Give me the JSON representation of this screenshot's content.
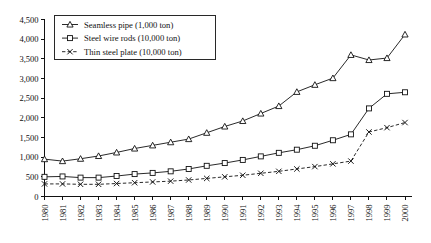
{
  "chart_data": {
    "type": "line",
    "title": "",
    "subtitle": "",
    "xlabel": "",
    "ylabel": "",
    "ylim": [
      0,
      4500
    ],
    "ytick_step": 500,
    "grid": false,
    "legend_position": "top-left",
    "x": [
      "1980",
      "1981",
      "1982",
      "1983",
      "1984",
      "1985",
      "1986",
      "1987",
      "1988",
      "1989",
      "1990",
      "1991",
      "1992",
      "1993",
      "1994",
      "1995",
      "1996",
      "1997",
      "1998",
      "1999",
      "2000"
    ],
    "ytick_labels": [
      "0",
      "500",
      "1,000",
      "1,500",
      "2,000",
      "2,500",
      "3,000",
      "3,500",
      "4,000",
      "4,500"
    ],
    "ytick_values": [
      0,
      500,
      1000,
      1500,
      2000,
      2500,
      3000,
      3500,
      4000,
      4500
    ],
    "series": [
      {
        "name": "Seamless pipe (1,000 ton)",
        "marker": "triangle",
        "linestyle": "solid",
        "values": [
          950,
          900,
          960,
          1030,
          1120,
          1220,
          1300,
          1380,
          1460,
          1620,
          1780,
          1920,
          2110,
          2300,
          2660,
          2840,
          3010,
          3180,
          3280,
          3320,
          3600
        ]
      },
      {
        "name": "Steel wire rods (10,000 ton)",
        "marker": "square",
        "linestyle": "solid",
        "values": [
          500,
          510,
          480,
          480,
          520,
          570,
          600,
          640,
          700,
          780,
          850,
          930,
          1020,
          1110,
          1190,
          1290,
          1430,
          1580,
          1700,
          1850,
          1960
        ]
      },
      {
        "name": "Thin steel plate (10,000 ton)",
        "marker": "cross",
        "linestyle": "dashed",
        "values": [
          320,
          320,
          310,
          310,
          330,
          350,
          370,
          390,
          420,
          460,
          500,
          540,
          590,
          640,
          700,
          760,
          830,
          900,
          960,
          1030,
          1120
        ]
      }
    ],
    "series_tail": {
      "note": "values continue to 2000",
      "seamless_pipe_end": [
        3600,
        3470,
        3520,
        4120
      ],
      "steel_wire_rods_end": [
        2240,
        2610,
        2650
      ],
      "thin_steel_plate_end": [
        1640,
        1750,
        1880
      ]
    }
  },
  "colors": {
    "line": "#111111",
    "marker_fill": "#ffffff",
    "background": "#ffffff"
  }
}
